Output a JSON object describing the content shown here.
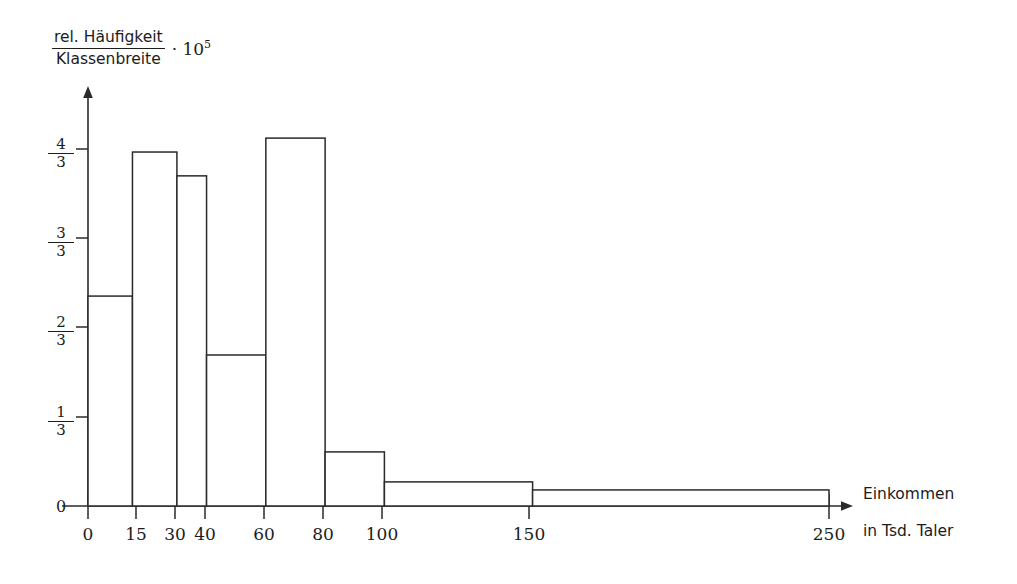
{
  "chart_data": {
    "type": "bar",
    "title": "",
    "subtitle": "",
    "ylabel_numerator": "rel. Häufigkeit",
    "ylabel_denominator": "Klassenbreite",
    "ylabel_multiplier_dot": "·",
    "ylabel_multiplier_base": "10",
    "ylabel_multiplier_exp": "5",
    "xlabel_line1": "Einkommen",
    "xlabel_line2": "in Tsd. Taler",
    "xlim": [
      0,
      250
    ],
    "ylim": [
      0,
      1.45
    ],
    "grid": false,
    "legend": null,
    "x_tick_labels": [
      "0",
      "15",
      "30",
      "40",
      "60",
      "80",
      "100",
      "150",
      "250"
    ],
    "x_tick_values": [
      0,
      15,
      30,
      40,
      60,
      80,
      100,
      150,
      250
    ],
    "y_tick_labels": [
      "0",
      "1/3",
      "2/3",
      "3/3",
      "4/3"
    ],
    "y_tick_values": [
      0,
      0.3333,
      0.6667,
      1.0,
      1.3333
    ],
    "y_tick_fractions": [
      {
        "num": "",
        "den": "",
        "whole": "0"
      },
      {
        "num": "1",
        "den": "3",
        "whole": ""
      },
      {
        "num": "2",
        "den": "3",
        "whole": ""
      },
      {
        "num": "3",
        "den": "3",
        "whole": ""
      },
      {
        "num": "4",
        "den": "3",
        "whole": ""
      }
    ],
    "bin_edges": [
      0,
      15,
      30,
      40,
      60,
      80,
      100,
      150,
      250
    ],
    "categories": [
      "0-15",
      "15-30",
      "30-40",
      "40-60",
      "60-80",
      "80-100",
      "100-150",
      "150-250"
    ],
    "values": [
      0.784,
      1.322,
      1.233,
      0.564,
      1.374,
      0.202,
      0.09,
      0.06
    ],
    "bar_fill_color": "#ffffff",
    "bar_edge_color": "#2a2a2a",
    "axis_color": "#2a2a2a",
    "background_color": "#ffffff"
  }
}
